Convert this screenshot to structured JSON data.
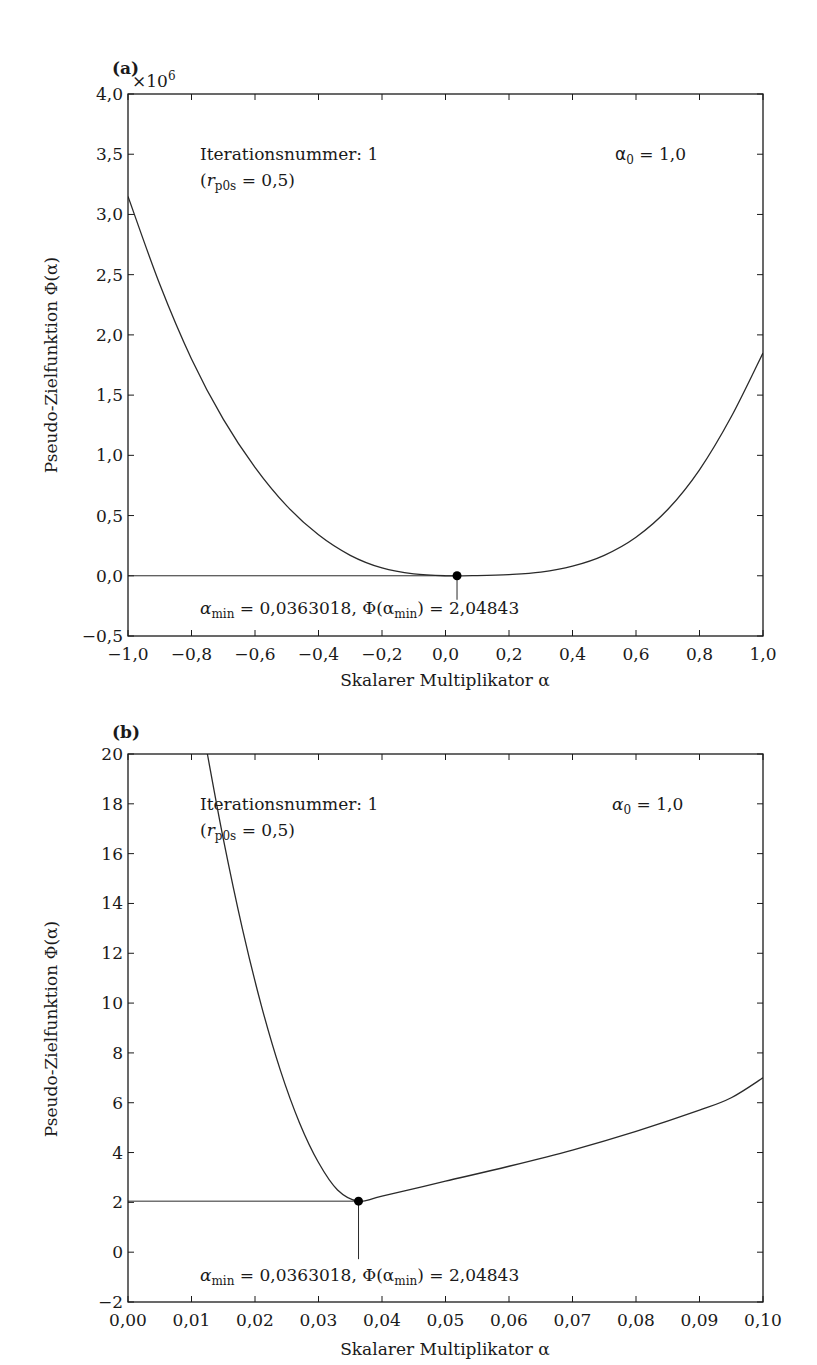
{
  "chart_data": [
    {
      "panel": "(a)",
      "type": "line",
      "title": "",
      "xlabel": "Skalarer Multiplikator α",
      "ylabel": "Pseudo-Zielfunktion Φ(α)",
      "y_multiplier_label": "×10⁶",
      "xlim": [
        -1.0,
        1.0
      ],
      "ylim": [
        -0.5,
        4.0
      ],
      "x_ticks": [
        "−1,0",
        "−0,8",
        "−0,6",
        "−0,4",
        "−0,2",
        "0,0",
        "0,2",
        "0,4",
        "0,6",
        "0,8",
        "1,0"
      ],
      "y_ticks": [
        "−0,5",
        "0,0",
        "0,5",
        "1,0",
        "1,5",
        "2,0",
        "2,5",
        "3,0",
        "3,5",
        "4,0"
      ],
      "grid": false,
      "series": [
        {
          "name": "Φ(α)",
          "x": [
            -1.0,
            -0.9,
            -0.8,
            -0.7,
            -0.6,
            -0.5,
            -0.4,
            -0.3,
            -0.2,
            -0.1,
            0.0,
            0.1,
            0.2,
            0.3,
            0.4,
            0.5,
            0.6,
            0.7,
            0.8,
            0.9,
            1.0
          ],
          "y_scaled_1e6": [
            3.15,
            2.42,
            1.8,
            1.3,
            0.9,
            0.58,
            0.34,
            0.17,
            0.065,
            0.015,
            0.0,
            0.002,
            0.01,
            0.03,
            0.08,
            0.17,
            0.32,
            0.55,
            0.88,
            1.32,
            1.85
          ]
        }
      ],
      "annotations": {
        "iteration": "Iterationsnummer: 1",
        "rp0s": "(r_p0s = 0,5)",
        "alpha0": "α₀ = 1,0",
        "minimum": "α_min = 0,0363018, Φ(α_min) = 2,04843",
        "min_point": {
          "x": 0.0363018,
          "y": 2.04843
        }
      }
    },
    {
      "panel": "(b)",
      "type": "line",
      "title": "",
      "xlabel": "Skalarer Multiplikator α",
      "ylabel": "Pseudo-Zielfunktion Φ(α)",
      "xlim": [
        0.0,
        0.1
      ],
      "ylim": [
        -2,
        20
      ],
      "x_ticks": [
        "0,00",
        "0,01",
        "0,02",
        "0,03",
        "0,04",
        "0,05",
        "0,06",
        "0,07",
        "0,08",
        "0,09",
        "0,10"
      ],
      "y_ticks": [
        "−2",
        "0",
        "2",
        "4",
        "6",
        "8",
        "10",
        "12",
        "14",
        "16",
        "18",
        "20"
      ],
      "grid": false,
      "series": [
        {
          "name": "Φ(α)",
          "x": [
            0.0125,
            0.015,
            0.018,
            0.021,
            0.024,
            0.027,
            0.03,
            0.033,
            0.0363018,
            0.04,
            0.05,
            0.06,
            0.07,
            0.08,
            0.09,
            0.095,
            0.1
          ],
          "y": [
            20.0,
            16.6,
            13.0,
            9.9,
            7.3,
            5.2,
            3.6,
            2.5,
            2.04843,
            2.25,
            2.85,
            3.45,
            4.1,
            4.85,
            5.7,
            6.2,
            7.0
          ]
        }
      ],
      "annotations": {
        "iteration": "Iterationsnummer: 1",
        "rp0s": "(r_p0s = 0,5)",
        "alpha0": "α₀ = 1,0",
        "minimum": "α_min = 0,0363018, Φ(α_min) = 2,04843",
        "min_point": {
          "x": 0.0363018,
          "y": 2.04843
        }
      }
    }
  ],
  "panels": {
    "a": {
      "tag": "(a)",
      "multiplier": "×10",
      "multiplier_exp": "6",
      "ylabel": "Pseudo-Zielfunktion Φ(α)",
      "xlabel": "Skalarer Multiplikator α",
      "iteration_text": "Iterationsnummer: 1",
      "rp0s_prefix": "(",
      "rp0s_r": "r",
      "rp0s_sub": "p0s",
      "rp0s_suffix": " = 0,5)",
      "alpha0_a": "α",
      "alpha0_sub": "0",
      "alpha0_rest": " = 1,0",
      "min_alpha": "α",
      "min_sub": "min",
      "min_mid": " = 0,0363018, Φ(α",
      "min_sub2": "min",
      "min_end": ") = 2,04843"
    },
    "b": {
      "tag": "(b)",
      "ylabel": "Pseudo-Zielfunktion Φ(α)",
      "xlabel": "Skalarer Multiplikator α",
      "iteration_text": "Iterationsnummer: 1",
      "rp0s_prefix": "(",
      "rp0s_r": "r",
      "rp0s_sub": "p0s",
      "rp0s_suffix": " = 0,5)",
      "alpha0_a": "α",
      "alpha0_sub": "0",
      "alpha0_rest": " = 1,0",
      "min_alpha": "α",
      "min_sub": "min",
      "min_mid": " = 0,0363018, Φ(α",
      "min_sub2": "min",
      "min_end": ") = 2,04843"
    }
  },
  "colors": {
    "line": "#2a2a2a",
    "axis": "#1a1a1a",
    "background": "#ffffff"
  }
}
